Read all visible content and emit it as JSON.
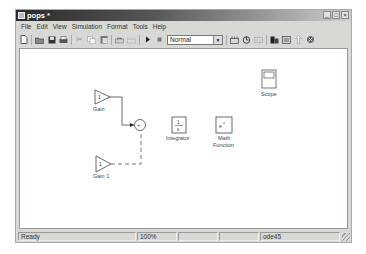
{
  "window": {
    "title": "pops *",
    "controls": {
      "minimize": "_",
      "maximize": "□",
      "close": "×"
    }
  },
  "menu": [
    "File",
    "Edit",
    "View",
    "Simulation",
    "Format",
    "Tools",
    "Help"
  ],
  "toolbar": {
    "icons": [
      "new-icon",
      "open-icon",
      "save-icon",
      "print-icon",
      "cut-icon",
      "copy-icon",
      "paste-icon",
      "undo-icon",
      "redo-icon",
      "play-icon",
      "stop-icon"
    ],
    "mode": "Normal",
    "right_icons": [
      "build-icon",
      "update-icon",
      "library-icon",
      "model-browser-icon",
      "explorer-icon",
      "up-arrow-icon",
      "debug-icon"
    ]
  },
  "diagram": {
    "blocks": [
      {
        "id": "gain",
        "label": "Gain",
        "value": "1",
        "type": "gain"
      },
      {
        "id": "gain1",
        "label": "Gain 1",
        "value": "1",
        "type": "gain"
      },
      {
        "id": "sum",
        "label": "",
        "type": "sum"
      },
      {
        "id": "integrator",
        "label": "Integrator",
        "value_num": "1",
        "value_den": "s",
        "type": "integrator"
      },
      {
        "id": "math",
        "label1": "Math",
        "label2": "Function",
        "value": "e",
        "exp": "u",
        "type": "math"
      },
      {
        "id": "scope",
        "label": "Scope",
        "type": "scope"
      }
    ]
  },
  "status": {
    "state": "Ready",
    "zoom": "100%",
    "cell3": "",
    "cell4": "",
    "solver": "ode45"
  }
}
